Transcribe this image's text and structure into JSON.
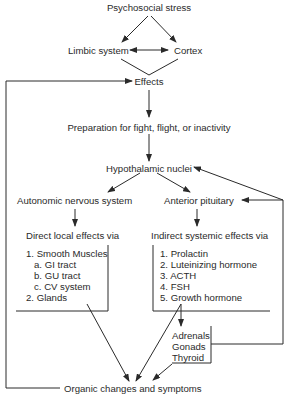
{
  "diagram": {
    "nodes": {
      "stress": "Psychosocial stress",
      "limbic": "Limbic system",
      "cortex": "Cortex",
      "effects": "Effects",
      "preparation": "Preparation for fight, flight, or inactivity",
      "hypothalamic": "Hypothalamic nuclei",
      "autonomic": "Autonomic nervous system",
      "anterior_pituitary": "Anterior pituitary",
      "direct_effects": "Direct local effects via",
      "indirect_effects": "Indirect systemic effects via",
      "organic": "Organic changes and symptoms"
    },
    "direct_list": [
      "1.  Smooth Muscles",
      "a.  GI tract",
      "b.  GU tract",
      "c.  CV system",
      "2.  Glands"
    ],
    "indirect_list": [
      "1.  Prolactin",
      "2.  Luteinizing hormone",
      "3.  ACTH",
      "4.  FSH",
      "5.  Growth hormone"
    ],
    "glands_list": [
      "Adrenals",
      "Gonads",
      "Thyroid"
    ],
    "colors": {
      "line": "#2a2a2a",
      "text": "#2a2a2a",
      "background": "#ffffff"
    }
  }
}
